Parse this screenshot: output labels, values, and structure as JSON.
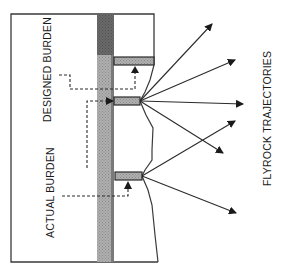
{
  "labels": {
    "designed_burden": "DESIGNED BURDEN",
    "actual_burden": "ACTUAL BURDEN",
    "flyrock_trajectories": "FLYROCK TRAJECTORIES"
  },
  "colors": {
    "line": "#2b2b2b",
    "column_dark": "#6e6e6e",
    "column_hatch": "#a8a8a8",
    "charge_fill": "#a3a3a3",
    "background": "#ffffff"
  },
  "diagram": {
    "charges": [
      {
        "name": "upper-charge",
        "x": 114,
        "y": 57,
        "w": 40,
        "h": 8
      },
      {
        "name": "middle-charge",
        "x": 114,
        "y": 97,
        "w": 26,
        "h": 8
      },
      {
        "name": "lower-charge",
        "x": 115,
        "y": 172,
        "w": 27,
        "h": 8
      }
    ],
    "trajectories": [
      {
        "from": [
          140,
          101
        ],
        "to": [
          212,
          24
        ]
      },
      {
        "from": [
          140,
          101
        ],
        "to": [
          235,
          60
        ]
      },
      {
        "from": [
          140,
          101
        ],
        "to": [
          243,
          104
        ]
      },
      {
        "from": [
          140,
          101
        ],
        "to": [
          223,
          153
        ]
      },
      {
        "from": [
          142,
          176
        ],
        "to": [
          235,
          121
        ]
      },
      {
        "from": [
          142,
          176
        ],
        "to": [
          236,
          213
        ]
      }
    ]
  }
}
